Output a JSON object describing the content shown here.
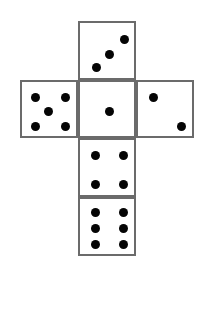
{
  "figure": {
    "kind": "dice-net-diagram",
    "canvas": {
      "width": 205,
      "height": 318
    },
    "background_color": "#ffffff",
    "face_border_color": "#6b6b6b",
    "face_fill_color": "#ffffff",
    "pip_color": "#050505",
    "face_size": 58,
    "border_width": 2,
    "pip_diameter": 9
  },
  "faces": [
    {
      "id": "face-top",
      "name": "top-face",
      "grid_position": {
        "row": 0,
        "column": 1
      },
      "bounds": {
        "x": 78,
        "y": 21,
        "width": 58,
        "height": 59
      },
      "pip_count": 3,
      "pip_arrangement": "diagonal-ascending",
      "pips": [
        {
          "cx": 16,
          "cy": 44
        },
        {
          "cx": 29,
          "cy": 31
        },
        {
          "cx": 44,
          "cy": 16
        }
      ]
    },
    {
      "id": "face-left",
      "name": "left-face",
      "grid_position": {
        "row": 1,
        "column": 0
      },
      "bounds": {
        "x": 20,
        "y": 80,
        "width": 58,
        "height": 58
      },
      "pip_count": 5,
      "pip_arrangement": "quincunx",
      "pips": [
        {
          "cx": 13,
          "cy": 15
        },
        {
          "cx": 43,
          "cy": 15
        },
        {
          "cx": 26,
          "cy": 29
        },
        {
          "cx": 13,
          "cy": 44
        },
        {
          "cx": 43,
          "cy": 44
        }
      ]
    },
    {
      "id": "face-center",
      "name": "center-face",
      "grid_position": {
        "row": 1,
        "column": 1
      },
      "bounds": {
        "x": 78,
        "y": 80,
        "width": 58,
        "height": 58
      },
      "pip_count": 1,
      "pip_arrangement": "center",
      "pips": [
        {
          "cx": 29,
          "cy": 29
        }
      ]
    },
    {
      "id": "face-right",
      "name": "right-face",
      "grid_position": {
        "row": 1,
        "column": 2
      },
      "bounds": {
        "x": 136,
        "y": 80,
        "width": 58,
        "height": 58
      },
      "pip_count": 2,
      "pip_arrangement": "diagonal-descending",
      "pips": [
        {
          "cx": 15,
          "cy": 15
        },
        {
          "cx": 43,
          "cy": 44
        }
      ]
    },
    {
      "id": "face-lower",
      "name": "lower-face",
      "grid_position": {
        "row": 2,
        "column": 1
      },
      "bounds": {
        "x": 78,
        "y": 138,
        "width": 58,
        "height": 59
      },
      "pip_count": 4,
      "pip_arrangement": "four-corners",
      "pips": [
        {
          "cx": 15,
          "cy": 15
        },
        {
          "cx": 43,
          "cy": 15
        },
        {
          "cx": 15,
          "cy": 44
        },
        {
          "cx": 43,
          "cy": 44
        }
      ]
    },
    {
      "id": "face-bottom",
      "name": "bottom-face",
      "grid_position": {
        "row": 3,
        "column": 1
      },
      "bounds": {
        "x": 78,
        "y": 197,
        "width": 58,
        "height": 59
      },
      "pip_count": 6,
      "pip_arrangement": "two-columns-of-three",
      "pips": [
        {
          "cx": 15,
          "cy": 13
        },
        {
          "cx": 43,
          "cy": 13
        },
        {
          "cx": 15,
          "cy": 29
        },
        {
          "cx": 43,
          "cy": 29
        },
        {
          "cx": 15,
          "cy": 45
        },
        {
          "cx": 43,
          "cy": 45
        }
      ]
    }
  ]
}
